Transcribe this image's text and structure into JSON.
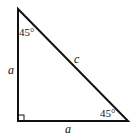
{
  "diagram": {
    "type": "right isosceles triangle",
    "labels": {
      "top_angle": "45°",
      "bottom_right_angle": "45°",
      "left_side": "a",
      "bottom_side": "a",
      "hypotenuse": "c"
    },
    "right_angle_marker": "bottom-left",
    "stroke_color": "#111111",
    "background": "#ffffff"
  }
}
